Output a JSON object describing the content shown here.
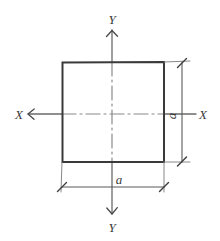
{
  "figure": {
    "background_color": "#ffffff",
    "line_color": "#3a3a3a",
    "centerline_color": "#6b6b6b",
    "dimension_color": "#5a5a5a",
    "width_px": 220,
    "height_px": 241
  },
  "axes": {
    "vertical": {
      "name": "Y-Y",
      "label_top": "Y",
      "label_bottom": "Y",
      "x_px": 112,
      "top_px": 30,
      "bottom_px": 214
    },
    "horizontal": {
      "name": "X-X",
      "label_left": "X",
      "label_right": "X",
      "y_px": 114,
      "left_px": 28,
      "right_px": 196
    }
  },
  "shape": {
    "type": "square",
    "left_px": 62,
    "top_px": 62,
    "right_px": 164,
    "bottom_px": 162,
    "side_length_symbol": "a"
  },
  "dimensions": [
    {
      "id": "width-dimension",
      "label": "a",
      "orientation": "horizontal",
      "line_y_px": 187,
      "from_px": 62,
      "to_px": 164,
      "label_x_px": 113,
      "label_y_px": 184
    },
    {
      "id": "height-dimension",
      "label": "a",
      "orientation": "vertical",
      "line_x_px": 182,
      "from_px": 62,
      "to_px": 162,
      "label_x_px": 178,
      "label_y_px": 112,
      "rotated_deg": -90
    }
  ]
}
